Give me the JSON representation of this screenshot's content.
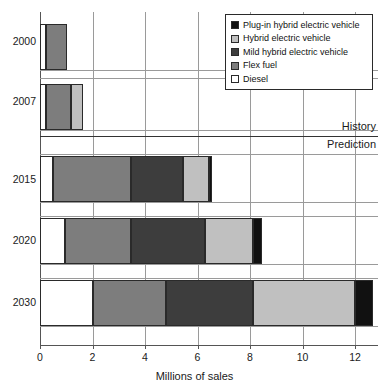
{
  "chart_data": {
    "type": "bar",
    "orientation": "horizontal",
    "stacked": true,
    "title": "",
    "xlabel": "Millions of sales",
    "ylabel": "",
    "xlim": [
      0,
      12.8
    ],
    "xticks": [
      0,
      2,
      4,
      6,
      8,
      10,
      12
    ],
    "xtick_labels": [
      "0",
      "2",
      "4",
      "6",
      "8",
      "10",
      "12"
    ],
    "grid": "vertical",
    "legend_position": "top-right",
    "categories": [
      "2000",
      "2007",
      "2015",
      "2020",
      "2030"
    ],
    "series": [
      {
        "name": "Diesel",
        "color": "#ffffff",
        "values": [
          0.22,
          0.22,
          0.5,
          0.95,
          2.0
        ]
      },
      {
        "name": "Flex fuel",
        "color": "#7d7d7d",
        "values": [
          0.8,
          0.95,
          2.95,
          2.5,
          2.8
        ]
      },
      {
        "name": "Mild hybrid electric vehicle",
        "color": "#3d3d3d",
        "values": [
          0,
          0,
          2.0,
          2.85,
          3.3
        ]
      },
      {
        "name": "Hybrid electric vehicle",
        "color": "#c0c0c0",
        "values": [
          0,
          0.48,
          0.97,
          1.8,
          3.9
        ]
      },
      {
        "name": "Plug-in hybrid electric vehicle",
        "color": "#111111",
        "values": [
          0,
          0,
          0.15,
          0.35,
          0.7
        ]
      }
    ],
    "totals": [
      1.02,
      1.65,
      6.57,
      8.45,
      12.7
    ],
    "annotations": [
      {
        "text": "History",
        "position": "above-divider-right"
      },
      {
        "text": "Prediction",
        "position": "below-divider-right"
      }
    ],
    "divider": {
      "between": [
        "2007",
        "2015"
      ]
    }
  },
  "legend": {
    "items": [
      {
        "label": "Plug-in hybrid electric vehicle",
        "color": "#111111"
      },
      {
        "label": "Hybrid electric vehicle",
        "color": "#c0c0c0"
      },
      {
        "label": "Mild hybrid electric vehicle",
        "color": "#3d3d3d"
      },
      {
        "label": "Flex fuel",
        "color": "#7d7d7d"
      },
      {
        "label": "Diesel",
        "color": "#ffffff"
      }
    ]
  },
  "axis": {
    "x_title": "Millions of sales",
    "ticks": [
      "0",
      "2",
      "4",
      "6",
      "8",
      "10",
      "12"
    ]
  },
  "categories": [
    "2000",
    "2007",
    "2015",
    "2020",
    "2030"
  ],
  "annotations": {
    "history": "History",
    "prediction": "Prediction"
  }
}
